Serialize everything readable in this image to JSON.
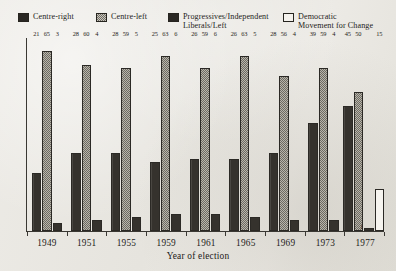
{
  "legend": {
    "items": [
      {
        "label": "Centre-right",
        "swatch": "dark-solid-swatch",
        "color": "#2a2824"
      },
      {
        "label": "Centre-left",
        "swatch": "hatched-gray-swatch",
        "color": "#b8b5ab"
      },
      {
        "label": "Progressives/Independent\nLiberals/Left",
        "swatch": "dark-solid-swatch",
        "color": "#2a2824"
      },
      {
        "label": "Democratic\nMovement for Change",
        "swatch": "white-outline-swatch",
        "color": "#f4f2ed"
      }
    ]
  },
  "axis": {
    "x_title": "Year of election"
  },
  "chart_data": {
    "type": "bar",
    "title": "",
    "xlabel": "Year of election",
    "ylabel": "",
    "ylim": [
      0,
      70
    ],
    "grid": false,
    "legend_position": "top",
    "categories": [
      "1949",
      "1951",
      "1955",
      "1959",
      "1961",
      "1965",
      "1969",
      "1973",
      "1977"
    ],
    "series": [
      {
        "name": "Centre-right",
        "color": "#2a2824",
        "values": [
          21,
          28,
          28,
          25,
          26,
          26,
          28,
          39,
          45
        ]
      },
      {
        "name": "Centre-left",
        "color": "#b8b5ab",
        "values": [
          65,
          60,
          59,
          63,
          59,
          63,
          56,
          59,
          50
        ]
      },
      {
        "name": "Progressives/Independent Liberals/Left",
        "color": "#2a2824",
        "values": [
          3,
          4,
          5,
          6,
          6,
          5,
          4,
          4,
          1
        ]
      },
      {
        "name": "Democratic Movement for Change",
        "color": "#f4f2ed",
        "values": [
          null,
          null,
          null,
          null,
          null,
          null,
          null,
          null,
          15
        ]
      }
    ]
  }
}
